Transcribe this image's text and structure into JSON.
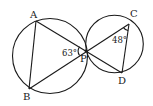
{
  "figure": {
    "points": {
      "A": {
        "label": "A",
        "x": 36,
        "y": 21
      },
      "B": {
        "label": "B",
        "x": 29,
        "y": 89
      },
      "P": {
        "label": "P",
        "x": 86,
        "y": 51
      },
      "C": {
        "label": "C",
        "x": 129,
        "y": 24
      },
      "D": {
        "label": "D",
        "x": 122,
        "y": 73
      }
    },
    "circles": [
      {
        "name": "left-circle",
        "cx": 50,
        "cy": 56,
        "r": 38
      },
      {
        "name": "right-circle",
        "cx": 114,
        "cy": 44,
        "r": 29
      }
    ],
    "segments": [
      "AB",
      "AP",
      "PD",
      "BP",
      "PC",
      "CD"
    ],
    "angles": {
      "APB": {
        "label": "63°",
        "vertex": "P"
      },
      "PCD": {
        "label": "48°",
        "vertex": "C"
      }
    },
    "colors": {
      "stroke": "#1a1a1a",
      "background": "#ffffff"
    }
  }
}
